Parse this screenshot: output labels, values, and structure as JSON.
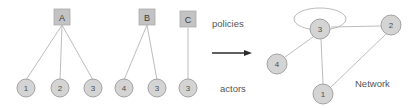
{
  "figure": {
    "colors": {
      "node_fill": "#d4d4d4",
      "node_stroke": "#9a9a9a",
      "box_fill": "#c0c0c0",
      "box_stroke": "#a8a8a8",
      "edge_stroke": "#b0b0b0",
      "arrow_color": "#2b2b2b",
      "text_color": "#555555",
      "background": "#ffffff"
    },
    "bipartite": {
      "policies": [
        {
          "id": "policy-a",
          "label": "A"
        },
        {
          "id": "policy-b",
          "label": "B"
        },
        {
          "id": "policy-c",
          "label": "C"
        }
      ],
      "actors": [
        {
          "id": "actor-a1",
          "label": "1"
        },
        {
          "id": "actor-a2",
          "label": "2"
        },
        {
          "id": "actor-a3",
          "label": "3"
        },
        {
          "id": "actor-b4",
          "label": "4"
        },
        {
          "id": "actor-b3",
          "label": "3"
        },
        {
          "id": "actor-c3",
          "label": "3"
        }
      ]
    },
    "annotations": {
      "policies_label": "policies",
      "actors_label": "actors",
      "network_label": "Network",
      "arrow": "right-arrow"
    },
    "network": {
      "nodes": [
        {
          "id": "net-3",
          "label": "3"
        },
        {
          "id": "net-2",
          "label": "2"
        },
        {
          "id": "net-4",
          "label": "4"
        },
        {
          "id": "net-1",
          "label": "1"
        }
      ]
    }
  }
}
